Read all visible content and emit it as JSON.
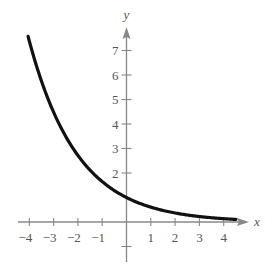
{
  "chart_data": {
    "type": "line",
    "title": "",
    "xlabel": "x",
    "ylabel": "y",
    "function": "y = e^(-x/2)",
    "xlim": [
      -4.2,
      4.9
    ],
    "ylim": [
      -1.5,
      8.0
    ],
    "grid": false,
    "legend": null,
    "x_ticks": [
      -4,
      -3,
      -2,
      -1,
      1,
      2,
      3,
      4
    ],
    "x_tick_labels": [
      "−4",
      "−3",
      "−2",
      "−1",
      "1",
      "2",
      "3",
      "4"
    ],
    "y_ticks": [
      -1,
      2,
      3,
      4,
      5,
      6,
      7
    ],
    "y_tick_labels": [
      "",
      "2",
      "3",
      "4",
      "5",
      "6",
      "7"
    ],
    "series": [
      {
        "name": "curve",
        "x": [
          -4,
          -3.5,
          -3,
          -2.5,
          -2,
          -1.5,
          -1,
          -0.5,
          0,
          0.5,
          1,
          1.5,
          2,
          2.5,
          3,
          3.5,
          4,
          4.5
        ],
        "y": [
          7.39,
          5.75,
          4.48,
          3.49,
          2.72,
          2.12,
          1.65,
          1.28,
          1.0,
          0.78,
          0.61,
          0.47,
          0.37,
          0.29,
          0.22,
          0.17,
          0.14,
          0.11
        ],
        "color": "#111111"
      }
    ],
    "axis_color": "#888888",
    "curve_color": "#111111"
  },
  "labels": {
    "x_axis": "x",
    "y_axis": "y"
  }
}
